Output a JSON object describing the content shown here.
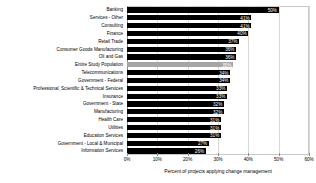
{
  "chart_data": {
    "type": "bar",
    "orientation": "horizontal",
    "title": "",
    "subtitle": "",
    "xlabel": "Percent of projects applying change management",
    "ylabel": "",
    "xlim": [
      0,
      60
    ],
    "xtick_labels": [
      "0%",
      "10%",
      "20%",
      "30%",
      "40%",
      "50%",
      "60%"
    ],
    "xtick_values": [
      0,
      10,
      20,
      30,
      40,
      50,
      60
    ],
    "grid": true,
    "legend": "none",
    "value_label_suffix": "%",
    "bar_color": "#000000",
    "highlight_color": "#a6a6a6",
    "highlight_category": "Entire Study Population",
    "categories": [
      "Banking",
      "Services - Other",
      "Consulting",
      "Finance",
      "Retail Trade",
      "Consumer Goods Manufacturing",
      "Oil and Gas",
      "Entire Study Population",
      "Telecommunications",
      "Government - Federal",
      "Professional, Scientific & Technical Services",
      "Insurance",
      "Government - State",
      "Manufacturing",
      "Health Care",
      "Utilities",
      "Education Services",
      "Government - Local & Municipal",
      "Information Services"
    ],
    "values": [
      50,
      41,
      41,
      40,
      37,
      36,
      36,
      35,
      34,
      34,
      33,
      33,
      32,
      32,
      31,
      31,
      31,
      27,
      26
    ],
    "value_labels": [
      "50%",
      "41%",
      "41%",
      "40%",
      "37%",
      "36%",
      "36%",
      "35%",
      "34%",
      "34%",
      "33%",
      "33%",
      "32%",
      "32%",
      "31%",
      "31%",
      "31%",
      "27%",
      "26%"
    ]
  }
}
